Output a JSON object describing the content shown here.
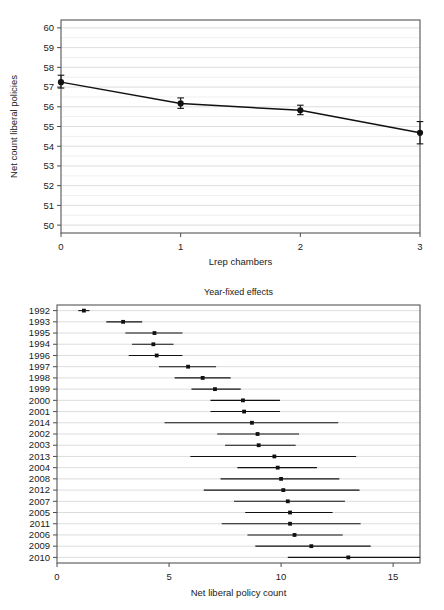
{
  "figure": {
    "background": "#ffffff",
    "ink": "#111111",
    "gridcolor": "#e6e6e6"
  },
  "chart_data": [
    {
      "id": "top",
      "type": "line",
      "title": "",
      "xlabel": "Lrep chambers",
      "ylabel": "Net count liberal policies",
      "x": [
        0,
        1,
        2,
        3
      ],
      "values": [
        57.25,
        56.17,
        55.82,
        54.68
      ],
      "ci_low": [
        56.95,
        55.92,
        55.6,
        54.12
      ],
      "ci_high": [
        57.6,
        56.45,
        56.08,
        55.25
      ],
      "xlim": [
        0,
        3
      ],
      "ylim": [
        49.6,
        60.4
      ],
      "xticks": [
        0,
        1,
        2,
        3
      ],
      "xticklabels": [
        "0",
        "1",
        "2",
        "3"
      ],
      "yticks": [
        50,
        51,
        52,
        53,
        54,
        55,
        56,
        57,
        58,
        59,
        60
      ],
      "yticklabels": [
        "50",
        "51",
        "52",
        "53",
        "54",
        "55",
        "56",
        "57",
        "58",
        "59",
        "60"
      ],
      "grid": "horizontal-major-and-minor",
      "legend": "none",
      "error_bars": true,
      "marker": "filled-circle"
    },
    {
      "id": "bottom",
      "type": "scatter",
      "title": "Year-fixed effects",
      "xlabel": "Net liberal policy count",
      "ylabel": "",
      "xlim": [
        0,
        16.2
      ],
      "xticks": [
        0,
        5,
        10,
        15
      ],
      "xticklabels": [
        "0",
        "5",
        "10",
        "15"
      ],
      "grid": "horizontal",
      "legend": "none",
      "error_bars": true,
      "marker": "filled-square",
      "categories": [
        "1992",
        "1993",
        "1995",
        "1994",
        "1996",
        "1997",
        "1998",
        "1999",
        "2000",
        "2001",
        "2014",
        "2002",
        "2003",
        "2013",
        "2004",
        "2008",
        "2012",
        "2007",
        "2005",
        "2011",
        "2006",
        "2009",
        "2010"
      ],
      "values": [
        1.2,
        2.95,
        4.35,
        4.3,
        4.45,
        5.85,
        6.5,
        7.05,
        8.3,
        8.35,
        8.7,
        8.95,
        9.0,
        9.7,
        9.85,
        10.0,
        10.1,
        10.3,
        10.4,
        10.4,
        10.6,
        11.35,
        13.0
      ],
      "ci_low": [
        0.95,
        2.2,
        3.05,
        3.35,
        3.2,
        4.55,
        5.25,
        6.0,
        6.85,
        6.85,
        4.8,
        7.15,
        7.5,
        5.95,
        8.05,
        7.3,
        6.55,
        7.9,
        8.4,
        7.35,
        8.5,
        8.85,
        10.3
      ],
      "ci_high": [
        1.45,
        3.8,
        5.6,
        5.2,
        5.6,
        7.1,
        7.75,
        8.2,
        9.95,
        9.95,
        12.55,
        10.8,
        10.65,
        13.35,
        11.6,
        12.6,
        13.5,
        12.85,
        12.3,
        13.55,
        12.75,
        14.0,
        16.2
      ]
    }
  ]
}
